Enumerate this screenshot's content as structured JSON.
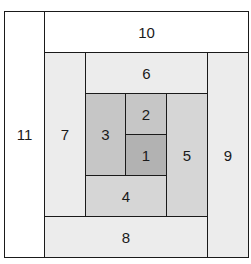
{
  "diagram": {
    "type": "log-cabin-quilt-block",
    "colors": {
      "shade_1": "#b2b2b2",
      "shade_2": "#c6c6c6",
      "shade_3": "#d6d6d6",
      "shade_4": "#ececec",
      "shade_5": "#ffffff",
      "line": "#1a1a1a"
    },
    "blocks": [
      {
        "id": "1",
        "label": "1",
        "x": 125,
        "y": 134,
        "w": 41,
        "h": 41,
        "color": "#b2b2b2"
      },
      {
        "id": "2",
        "label": "2",
        "x": 125,
        "y": 93,
        "w": 41,
        "h": 41,
        "color": "#c6c6c6"
      },
      {
        "id": "3",
        "label": "3",
        "x": 85,
        "y": 93,
        "w": 40,
        "h": 82,
        "color": "#c6c6c6"
      },
      {
        "id": "4",
        "label": "4",
        "x": 85,
        "y": 175,
        "w": 81,
        "h": 41,
        "color": "#d6d6d6"
      },
      {
        "id": "5",
        "label": "5",
        "x": 166,
        "y": 93,
        "w": 41,
        "h": 123,
        "color": "#d6d6d6"
      },
      {
        "id": "6",
        "label": "6",
        "x": 85,
        "y": 52,
        "w": 122,
        "h": 41,
        "color": "#ececec"
      },
      {
        "id": "7",
        "label": "7",
        "x": 44,
        "y": 52,
        "w": 41,
        "h": 164,
        "color": "#ececec"
      },
      {
        "id": "8",
        "label": "8",
        "x": 44,
        "y": 216,
        "w": 163,
        "h": 41,
        "color": "#ececec"
      },
      {
        "id": "9",
        "label": "9",
        "x": 207,
        "y": 52,
        "w": 41,
        "h": 205,
        "color": "#ececec"
      },
      {
        "id": "10",
        "label": "10",
        "x": 44,
        "y": 11,
        "w": 204,
        "h": 41,
        "color": "#ffffff"
      },
      {
        "id": "11",
        "label": "11",
        "x": 4,
        "y": 11,
        "w": 40,
        "h": 246,
        "color": "#ffffff"
      }
    ]
  }
}
